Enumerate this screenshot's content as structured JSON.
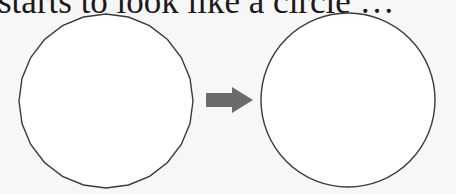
{
  "caption": "starts to look like a circle …",
  "diagram": {
    "polygon": {
      "label": "24-sided polygon",
      "sides": 24,
      "cx": 106,
      "cy": 101,
      "r": 87,
      "fill": "#ffffff",
      "stroke": "#3a3a3a"
    },
    "arrow": {
      "label": "transition arrow",
      "color": "#6b6b6b"
    },
    "circle": {
      "label": "circle",
      "cx": 348,
      "cy": 100,
      "r": 87,
      "fill": "#ffffff",
      "stroke": "#3a3a3a"
    }
  },
  "colors": {
    "background": "#f7f7f7",
    "text": "#1a1a1a"
  }
}
